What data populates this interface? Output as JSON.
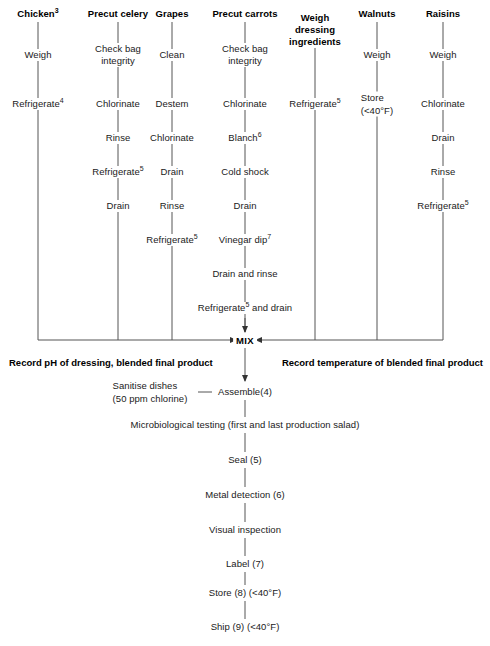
{
  "columns": [
    {
      "id": "chicken",
      "header": "Chicken",
      "header_sup": "3",
      "x": 38,
      "steps": [
        {
          "label": "Weigh",
          "sup": "",
          "y": 55
        },
        {
          "label": "Refrigerate",
          "sup": "4",
          "y": 104
        }
      ],
      "line_bottom": 340
    },
    {
      "id": "precut-celery",
      "header": "Precut celery",
      "header_sup": "",
      "x": 118,
      "steps": [
        {
          "label": "Check bag integrity",
          "sup": "",
          "y": 55,
          "two_line": true
        },
        {
          "label": "Chlorinate",
          "sup": "",
          "y": 104
        },
        {
          "label": "Rinse",
          "sup": "",
          "y": 138
        },
        {
          "label": "Refrigerate",
          "sup": "5",
          "y": 172
        },
        {
          "label": "Drain",
          "sup": "",
          "y": 206
        }
      ],
      "line_bottom": 340
    },
    {
      "id": "grapes",
      "header": "Grapes",
      "header_sup": "",
      "x": 172,
      "steps": [
        {
          "label": "Clean",
          "sup": "",
          "y": 55
        },
        {
          "label": "Destem",
          "sup": "",
          "y": 104
        },
        {
          "label": "Chlorinate",
          "sup": "",
          "y": 138
        },
        {
          "label": "Drain",
          "sup": "",
          "y": 172
        },
        {
          "label": "Rinse",
          "sup": "",
          "y": 206
        },
        {
          "label": "Refrigerate",
          "sup": "5",
          "y": 240
        }
      ],
      "line_bottom": 340
    },
    {
      "id": "precut-carrots",
      "header": "Precut carrots",
      "header_sup": "",
      "x": 245,
      "steps": [
        {
          "label": "Check bag integrity",
          "sup": "",
          "y": 55,
          "two_line": true
        },
        {
          "label": "Chlorinate",
          "sup": "",
          "y": 104
        },
        {
          "label": "Blanch",
          "sup": "6",
          "y": 138
        },
        {
          "label": "Cold shock",
          "sup": "",
          "y": 172
        },
        {
          "label": "Drain",
          "sup": "",
          "y": 206
        },
        {
          "label": "Vinegar dip",
          "sup": "7",
          "y": 240
        },
        {
          "label": "Drain and rinse",
          "sup": "",
          "y": 274
        },
        {
          "label": "Refrigerate",
          "sup": "5",
          "sup_after": " and drain",
          "y": 308
        }
      ],
      "line_bottom": 332
    },
    {
      "id": "weigh-dressing-ingredients",
      "header": "Weigh dressing ingredients",
      "header_sup": "",
      "x": 315,
      "header_three_line": true,
      "steps": [
        {
          "label": "Refrigerate",
          "sup": "5",
          "y": 104
        }
      ],
      "line_bottom": 340
    },
    {
      "id": "walnuts",
      "header": "Walnuts",
      "header_sup": "",
      "x": 377,
      "steps": [
        {
          "label": "Weigh",
          "sup": "",
          "y": 55
        },
        {
          "label": "Store",
          "sup": "",
          "sublabel": "(<40°F)",
          "y": 104
        }
      ],
      "line_bottom": 340
    },
    {
      "id": "raisins",
      "header": "Raisins",
      "header_sup": "",
      "x": 443,
      "steps": [
        {
          "label": "Weigh",
          "sup": "",
          "y": 55
        },
        {
          "label": "Chlorinate",
          "sup": "",
          "y": 104
        },
        {
          "label": "Drain",
          "sup": "",
          "y": 138
        },
        {
          "label": "Rinse",
          "sup": "",
          "y": 172
        },
        {
          "label": "Refrigerate",
          "sup": "5",
          "y": 206
        }
      ],
      "line_bottom": 340
    }
  ],
  "mix": {
    "label": "MIX",
    "x": 245,
    "y": 340
  },
  "records": {
    "left": "Record pH of dressing, blended final product",
    "right": "Record temperature of blended final product"
  },
  "sanitise": {
    "line1": "Sanitise dishes",
    "line2": "(50 ppm chlorine)",
    "x": 150,
    "y": 392
  },
  "main_chain": [
    {
      "label": "Assemble(4)",
      "y": 392
    },
    {
      "label": "Microbiological testing (first and last production salad)",
      "y": 425
    },
    {
      "label": "Seal (5)",
      "y": 460
    },
    {
      "label": "Metal detection (6)",
      "y": 495
    },
    {
      "label": "Visual inspection",
      "y": 530
    },
    {
      "label": "Label (7)",
      "y": 564
    },
    {
      "label": "Store (8) (<40°F)",
      "y": 593
    },
    {
      "label": "Ship (9) (<40°F)",
      "y": 627
    }
  ],
  "colors": {
    "line": "#555555",
    "text": "#1a1a1a",
    "heading": "#000000",
    "background": "#ffffff"
  }
}
